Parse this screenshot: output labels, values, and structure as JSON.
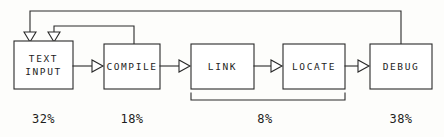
{
  "diagram": {
    "background_color": "#fdfdfb",
    "stroke_color": "#2a2a2a",
    "box_fill_color": "#ffffff",
    "stages": [
      {
        "id": "text-input",
        "label_line1": "TEXT",
        "label_line2": "INPUT",
        "percent": "32%",
        "box": {
          "x": 14,
          "y": 41,
          "w": 59,
          "h": 48
        },
        "label_cx": 43.5,
        "pct_cx": 43.5
      },
      {
        "id": "compile",
        "label_line1": "COMPILE",
        "label_line2": "",
        "percent": "18%",
        "box": {
          "x": 104,
          "y": 44,
          "w": 56,
          "h": 45
        },
        "label_cx": 132,
        "pct_cx": 132
      },
      {
        "id": "link",
        "label_line1": "LINK",
        "label_line2": "",
        "percent": "",
        "box": {
          "x": 191,
          "y": 44,
          "w": 63,
          "h": 45
        },
        "label_cx": 222.5,
        "pct_cx": 222.5
      },
      {
        "id": "locate",
        "label_line1": "LOCATE",
        "label_line2": "",
        "percent": "",
        "box": {
          "x": 283,
          "y": 44,
          "w": 62,
          "h": 45
        },
        "label_cx": 314,
        "pct_cx": 314
      },
      {
        "id": "debug",
        "label_line1": "DEBUG",
        "label_line2": "",
        "percent": "38%",
        "box": {
          "x": 370,
          "y": 44,
          "w": 62,
          "h": 45
        },
        "label_cx": 401,
        "pct_cx": 401
      }
    ],
    "grouped_percent": {
      "label": "8%",
      "covers": "link-and-locate",
      "cx": 265
    },
    "percent_row_y": 119,
    "feedback_loops": [
      {
        "id": "debug-to-text-input",
        "from": "debug",
        "to": "text-input",
        "top_y": 11,
        "from_x": 401,
        "to_x": 30
      },
      {
        "id": "compile-to-text-input",
        "from": "compile",
        "to": "text-input",
        "top_y": 26,
        "from_x": 134,
        "to_x": 54
      }
    ],
    "forward_arrows": [
      {
        "id": "text-input-to-compile",
        "from_x": 73,
        "to_x": 104,
        "y": 66
      },
      {
        "id": "compile-to-link",
        "from_x": 160,
        "to_x": 191,
        "y": 66
      },
      {
        "id": "link-to-locate",
        "from_x": 254,
        "to_x": 283,
        "y": 66
      },
      {
        "id": "locate-to-debug",
        "from_x": 345,
        "to_x": 370,
        "y": 66
      }
    ],
    "group_bracket": {
      "x1": 191,
      "x2": 345,
      "y": 100,
      "tick_height": 7
    }
  }
}
